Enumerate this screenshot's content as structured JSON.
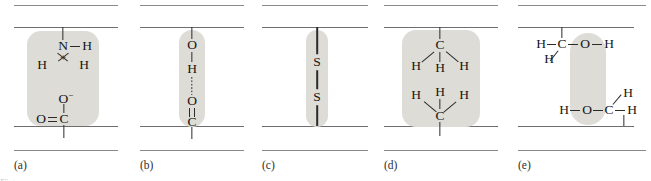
{
  "figure": {
    "width": 651,
    "height": 181,
    "background": "#ffffff",
    "highlight_color": "#dddcd7",
    "chain_color": "#6e6e6e",
    "atom_color": "#141414",
    "caption_fragment": "Figure"
  },
  "panels": [
    {
      "id": "a",
      "label": "(a)",
      "interaction": "ionic-bond",
      "atoms": [
        "N",
        "H",
        "H",
        "H",
        "+",
        "O−",
        "O",
        "C"
      ],
      "groups": [
        "protonated amine",
        "carboxylate"
      ],
      "charges": [
        "+",
        "−"
      ]
    },
    {
      "id": "b",
      "label": "(b)",
      "interaction": "hydrogen-bond",
      "atoms": [
        "O",
        "H",
        "O",
        "C"
      ],
      "groups": [
        "hydroxyl",
        "carbonyl"
      ],
      "bond_style": "dotted"
    },
    {
      "id": "c",
      "label": "(c)",
      "interaction": "disulfide-bridge",
      "atoms": [
        "S",
        "S"
      ],
      "groups": [
        "thiol",
        "thiol"
      ],
      "bond_style": "solid"
    },
    {
      "id": "d",
      "label": "(d)",
      "interaction": "hydrophobic-interaction",
      "atoms": [
        "C",
        "H",
        "H",
        "H",
        "H",
        "H",
        "H",
        "C"
      ],
      "groups": [
        "methyl",
        "methyl"
      ]
    },
    {
      "id": "e",
      "label": "(e)",
      "interaction": "polar-interaction",
      "atoms": [
        "H",
        "C",
        "O",
        "H",
        "H",
        "H",
        "O",
        "C",
        "H",
        "H"
      ],
      "groups": [
        "hydroxyl",
        "hydroxyl"
      ]
    }
  ],
  "atom_labels": {
    "N": "N",
    "H": "H",
    "O": "O",
    "C": "C",
    "S": "S",
    "plus": "+",
    "O_minus": "O",
    "minus_sup": "−"
  }
}
